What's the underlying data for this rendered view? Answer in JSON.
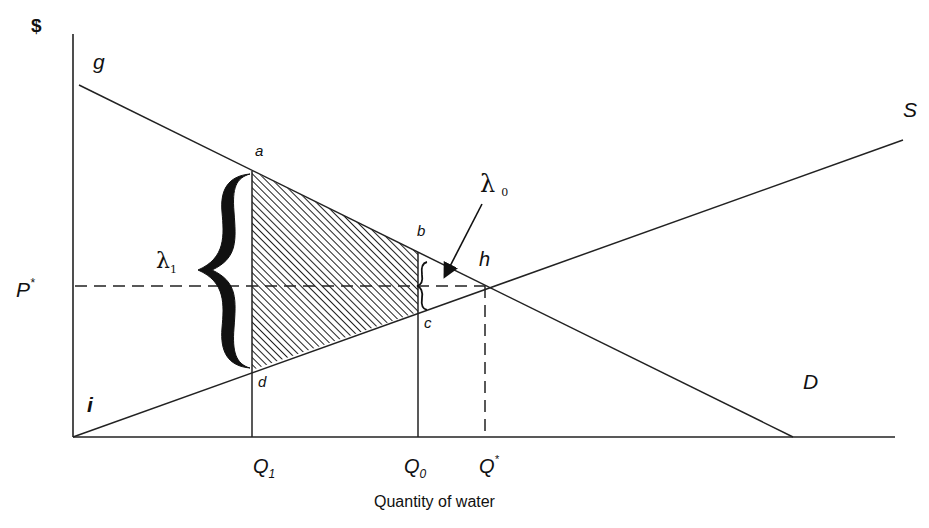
{
  "diagram": {
    "type": "supply-demand economics diagram",
    "y_axis_label": "$",
    "x_axis_label": "Quantity of water",
    "curves": {
      "demand": {
        "label": "D",
        "start_label": "g"
      },
      "supply": {
        "label": "S",
        "start_label": "i"
      }
    },
    "points": {
      "a": "a",
      "b": "b",
      "c": "c",
      "d": "d",
      "h": "h"
    },
    "price_label": "P",
    "price_superscript": "*",
    "quantity_ticks": [
      {
        "base": "Q",
        "sub": "1"
      },
      {
        "base": "Q",
        "sub": "0"
      },
      {
        "base": "Q",
        "sup": "*"
      }
    ],
    "lambda_labels": {
      "lambda1": {
        "symbol": "λ",
        "sub": "1"
      },
      "lambda0": {
        "symbol": "λ",
        "sub": "0"
      }
    },
    "shaded_region": "trapezoid a-b-c-d (hatched)"
  }
}
